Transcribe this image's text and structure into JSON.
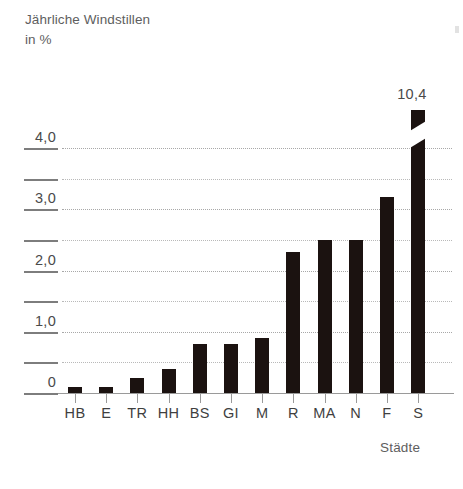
{
  "header": {
    "title_line_1": "Jährliche Windstillen",
    "title_line_2": "in %"
  },
  "axis": {
    "x_title": "Städte",
    "y_tick_labels": [
      "0",
      "1,0",
      "2,0",
      "3,0",
      "4,0"
    ]
  },
  "annotations": {
    "truncated_bar_value": "10,4"
  },
  "chart_data": {
    "type": "bar",
    "title": "Jährliche Windstillen in %",
    "subtitle": "in %",
    "xlabel": "Städte",
    "ylabel": "in %",
    "ylim": [
      0,
      4.0
    ],
    "grid": true,
    "legend": false,
    "y_major_ticks": [
      0,
      1.0,
      2.0,
      3.0,
      4.0
    ],
    "y_minor_ticks": [
      0.5,
      1.5,
      2.5,
      3.5
    ],
    "y_tick_labels": [
      "0",
      "1,0",
      "2,0",
      "3,0",
      "4,0"
    ],
    "axis_break": {
      "present": true,
      "series_index": 11,
      "category": "S",
      "true_value": 10.4,
      "label": "10,4",
      "note": "Bar for S is truncated with a break mark; actual value 10,4 % exceeds the 4,0 axis maximum."
    },
    "categories": [
      "HB",
      "E",
      "TR",
      "HH",
      "BS",
      "GI",
      "M",
      "R",
      "MA",
      "N",
      "F",
      "S"
    ],
    "values": [
      0.1,
      0.1,
      0.25,
      0.4,
      0.8,
      0.8,
      0.9,
      2.3,
      2.5,
      2.5,
      3.2,
      10.4
    ],
    "bar_color": "#1b1210",
    "background_color": "#ffffff"
  }
}
